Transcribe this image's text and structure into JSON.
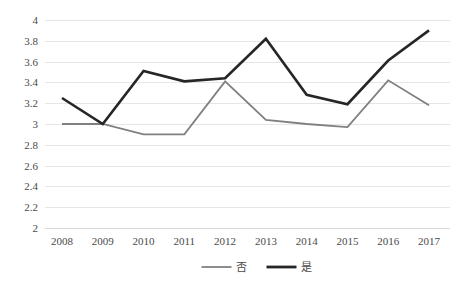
{
  "chart_data": {
    "type": "line",
    "title": "",
    "subtitle": "",
    "xlabel": "",
    "ylabel": "",
    "categories": [
      "2008",
      "2009",
      "2010",
      "2011",
      "2012",
      "2013",
      "2014",
      "2015",
      "2016",
      "2017"
    ],
    "series": [
      {
        "name": "否",
        "color": "#808080",
        "values": [
          3.0,
          3.0,
          2.9,
          2.9,
          3.41,
          3.04,
          3.0,
          2.97,
          3.42,
          3.18
        ]
      },
      {
        "name": "是",
        "color": "#262626",
        "values": [
          3.25,
          3.0,
          3.51,
          3.41,
          3.44,
          3.82,
          3.28,
          3.19,
          3.61,
          3.9
        ]
      }
    ],
    "ylim": [
      2,
      4
    ],
    "ytick_values": [
      4,
      3.8,
      3.6,
      3.4,
      3.2,
      3,
      2.8,
      2.6,
      2.4,
      2.2,
      2
    ],
    "ytick_labels": [
      "4",
      "3.8",
      "3.6",
      "3.4",
      "3.2",
      "3",
      "2.8",
      "2.6",
      "2.4",
      "2.2",
      "2"
    ],
    "grid": true,
    "grid_axis": "y",
    "legend_position": "bottom",
    "legend_entries": [
      {
        "label": "否",
        "color": "#808080"
      },
      {
        "label": "是",
        "color": "#262626"
      }
    ]
  },
  "plot": {
    "area": {
      "left": 45,
      "right": 450,
      "top": 20,
      "bottom": 228
    },
    "first_x": 62,
    "last_x": 429
  }
}
